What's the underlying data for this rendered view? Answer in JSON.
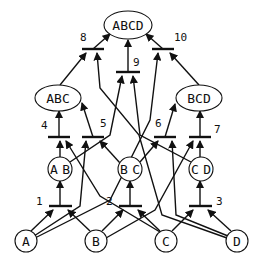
{
  "diagram": {
    "title": "",
    "nodes": [
      {
        "id": "A",
        "label": "A",
        "shape": "circle",
        "x": 26,
        "y": 241,
        "r": 11
      },
      {
        "id": "B",
        "label": "B",
        "shape": "circle",
        "x": 96,
        "y": 241,
        "r": 11
      },
      {
        "id": "C",
        "label": "C",
        "shape": "circle",
        "x": 166,
        "y": 241,
        "r": 11
      },
      {
        "id": "D",
        "label": "D",
        "shape": "circle",
        "x": 237,
        "y": 241,
        "r": 11
      },
      {
        "id": "AB",
        "label": "AB",
        "shape": "circle",
        "x": 60,
        "y": 169,
        "r": 12
      },
      {
        "id": "BC",
        "label": "BC",
        "shape": "circle",
        "x": 130,
        "y": 169,
        "r": 12
      },
      {
        "id": "CD",
        "label": "CD",
        "shape": "circle",
        "x": 201,
        "y": 169,
        "r": 12
      },
      {
        "id": "ABC",
        "label": "ABC",
        "shape": "ellipse",
        "x": 58,
        "y": 98,
        "rx": 23,
        "ry": 13
      },
      {
        "id": "BCD",
        "label": "BCD",
        "shape": "ellipse",
        "x": 199,
        "y": 98,
        "rx": 23,
        "ry": 13
      },
      {
        "id": "ABCD",
        "label": "ABCD",
        "shape": "ellipse",
        "x": 128,
        "y": 25,
        "rx": 24,
        "ry": 14
      }
    ],
    "bars": [
      {
        "id": "1",
        "label": "1",
        "x1": 49,
        "x2": 72,
        "y": 206,
        "label_x": 36,
        "label_y": 205,
        "output": "AB",
        "inputs": [
          "A",
          "B"
        ]
      },
      {
        "id": "2",
        "label": "2",
        "x1": 119,
        "x2": 142,
        "y": 206,
        "label_x": 106,
        "label_y": 205,
        "output": "BC",
        "inputs": [
          "B",
          "C"
        ]
      },
      {
        "id": "3",
        "label": "3",
        "x1": 189,
        "x2": 212,
        "y": 206,
        "label_x": 216,
        "label_y": 205,
        "output": "CD",
        "inputs": [
          "C",
          "D"
        ]
      },
      {
        "id": "4",
        "label": "4",
        "x1": 48,
        "x2": 70,
        "y": 137,
        "label_x": 41,
        "label_y": 129,
        "output": "ABC",
        "inputs": [
          "AB",
          "C"
        ]
      },
      {
        "id": "5",
        "label": "5",
        "x1": 82,
        "x2": 104,
        "y": 137,
        "label_x": 100,
        "label_y": 127,
        "output": "ABC",
        "inputs": [
          "A",
          "BC"
        ]
      },
      {
        "id": "6",
        "label": "6",
        "x1": 154,
        "x2": 176,
        "y": 137,
        "label_x": 155,
        "label_y": 127,
        "output": "BCD",
        "inputs": [
          "BC",
          "D"
        ]
      },
      {
        "id": "7",
        "label": "7",
        "x1": 189,
        "x2": 211,
        "y": 137,
        "label_x": 214,
        "label_y": 133,
        "output": "BCD",
        "inputs": [
          "B",
          "CD"
        ]
      },
      {
        "id": "8",
        "label": "8",
        "x1": 82,
        "x2": 104,
        "y": 49,
        "label_x": 80,
        "label_y": 41,
        "output": "ABCD",
        "inputs": [
          "ABC",
          "D"
        ]
      },
      {
        "id": "9",
        "label": "9",
        "x1": 116,
        "x2": 140,
        "y": 72,
        "label_x": 133,
        "label_y": 66,
        "output": "ABCD",
        "inputs": [
          "AB",
          "CD"
        ]
      },
      {
        "id": "10",
        "label": "10",
        "x1": 152,
        "x2": 174,
        "y": 49,
        "label_x": 174,
        "label_y": 41,
        "output": "ABCD",
        "inputs": [
          "A",
          "BCD"
        ]
      }
    ],
    "edges": [
      {
        "from": "A",
        "to": "bar1",
        "path": "M31,231 L53,210"
      },
      {
        "from": "B",
        "to": "bar1",
        "path": "M90,231 L68,210"
      },
      {
        "from": "bar1",
        "to": "AB",
        "path": "M60,206 L60,181"
      },
      {
        "from": "B",
        "to": "bar2",
        "path": "M102,231 L123,210"
      },
      {
        "from": "C",
        "to": "bar2",
        "path": "M160,231 L138,210"
      },
      {
        "from": "bar2",
        "to": "BC",
        "path": "M130,206 L130,181"
      },
      {
        "from": "C",
        "to": "bar3",
        "path": "M172,231 L193,210"
      },
      {
        "from": "D",
        "to": "bar3",
        "path": "M231,231 L208,210"
      },
      {
        "from": "bar3",
        "to": "CD",
        "path": "M200,206 L200,181"
      },
      {
        "from": "AB",
        "to": "bar4",
        "path": "M60,157 L60,141"
      },
      {
        "from": "C",
        "to": "bar4",
        "path": "M160,232 L100,196 L66,141"
      },
      {
        "from": "bar4",
        "to": "ABC",
        "path": "M59,137 L59,111"
      },
      {
        "from": "A",
        "to": "bar5",
        "path": "M34,236 L80,206 L86,141"
      },
      {
        "from": "BC",
        "to": "bar5",
        "path": "M120,163 L100,141"
      },
      {
        "from": "bar5",
        "to": "ABC",
        "path": "M93,137 L82,103"
      },
      {
        "from": "BC",
        "to": "bar6",
        "path": "M140,162 L158,141"
      },
      {
        "from": "D",
        "to": "bar6",
        "path": "M228,236 L176,215 L172,141"
      },
      {
        "from": "bar6",
        "to": "BCD",
        "path": "M165,137 L175,104"
      },
      {
        "from": "B",
        "to": "bar7",
        "path": "M106,238 L155,210 L193,141"
      },
      {
        "from": "CD",
        "to": "bar7",
        "path": "M200,157 L200,141"
      },
      {
        "from": "bar7",
        "to": "BCD",
        "path": "M200,137 L200,111"
      },
      {
        "from": "ABC",
        "to": "bar8",
        "path": "M60,85 L86,53"
      },
      {
        "from": "D",
        "to": "bar8",
        "path": "M227,238 L162,215 L139,135 L100,88 L97,53"
      },
      {
        "from": "bar8",
        "to": "ABCD",
        "path": "M93,49 L110,34"
      },
      {
        "from": "AB",
        "to": "bar9",
        "path": "M70,162 L110,135 L122,76"
      },
      {
        "from": "CD",
        "to": "bar9",
        "path": "M191,162 L140,135 L133,76"
      },
      {
        "from": "bar9",
        "to": "ABCD",
        "path": "M128,72 L128,40"
      },
      {
        "from": "A",
        "to": "bar10",
        "path": "M35,238 L110,200 L150,120 L158,53"
      },
      {
        "from": "BCD",
        "to": "bar10",
        "path": "M199,85 L170,53"
      },
      {
        "from": "bar10",
        "to": "ABCD",
        "path": "M163,49 L146,34"
      }
    ]
  }
}
